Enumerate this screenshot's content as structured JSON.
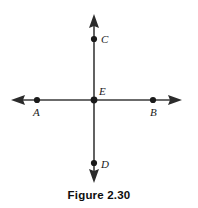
{
  "figure": {
    "caption": "Figure 2.30",
    "type": "geometry-diagram",
    "stroke_color": "#333333",
    "point_color": "#1a1a1a",
    "background_color": "#ffffff",
    "labels": {
      "C": "C",
      "E": "E",
      "A": "A",
      "B": "B",
      "D": "D"
    },
    "points": [
      {
        "name": "C",
        "x": 94,
        "y": 39
      },
      {
        "name": "E",
        "x": 94,
        "y": 100
      },
      {
        "name": "A",
        "x": 37,
        "y": 100
      },
      {
        "name": "B",
        "x": 153,
        "y": 100
      },
      {
        "name": "D",
        "x": 94,
        "y": 163
      }
    ],
    "lines": [
      {
        "name": "vertical-line",
        "x1": 94,
        "y1": 14,
        "x2": 94,
        "y2": 183,
        "arrows": "both"
      },
      {
        "name": "horizontal-line",
        "x1": 11,
        "y1": 100,
        "x2": 182,
        "y2": 100,
        "arrows": "both"
      }
    ]
  }
}
